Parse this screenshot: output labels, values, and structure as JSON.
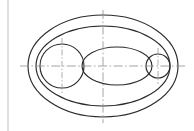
{
  "document": {
    "title": "Technical Drawing",
    "view_label": "",
    "background_color": "#ffffff",
    "line_color": "#2b2b2b",
    "centerline_color": "#8e8e8e",
    "border_color": "#b9b9b9"
  },
  "canvas": {
    "width": 194,
    "height": 131
  },
  "geometry": {
    "sheet_border": {
      "name": "left-margin-rule",
      "x1": 8,
      "y1": 0,
      "x2": 8,
      "y2": 131
    },
    "main_center": {
      "x": 103,
      "y": 66
    },
    "ellipses": [
      {
        "name": "outer-ellipse",
        "cx": 103,
        "cy": 66,
        "rx": 75,
        "ry": 51
      },
      {
        "name": "inner-ellipse",
        "cx": 103,
        "cy": 66,
        "rx": 67,
        "ry": 40
      },
      {
        "name": "middle-ellipse",
        "cx": 117,
        "cy": 66,
        "rx": 35,
        "ry": 19
      }
    ],
    "circles": [
      {
        "name": "left-circle",
        "cx": 62,
        "cy": 66,
        "r": 22
      },
      {
        "name": "right-circle",
        "cx": 158,
        "cy": 66,
        "r": 12
      }
    ],
    "centerlines": [
      {
        "name": "main-horizontal-centerline",
        "orientation": "horizontal",
        "x1": 20,
        "y1": 66,
        "x2": 186,
        "y2": 66
      },
      {
        "name": "main-vertical-centerline",
        "orientation": "vertical",
        "x1": 103,
        "y1": 10,
        "x2": 103,
        "y2": 123
      },
      {
        "name": "left-circle-vertical-centerline",
        "orientation": "vertical",
        "x1": 62,
        "y1": 38,
        "x2": 62,
        "y2": 94
      },
      {
        "name": "right-circle-vertical-centerline",
        "orientation": "vertical",
        "x1": 158,
        "y1": 48,
        "x2": 158,
        "y2": 84
      }
    ]
  },
  "chart_data": {
    "type": "diagram",
    "entities": [
      {
        "label": "Outer ellipse",
        "kind": "ellipse",
        "cx": 103,
        "cy": 66,
        "rx": 75,
        "ry": 51
      },
      {
        "label": "Inner ellipse",
        "kind": "ellipse",
        "cx": 103,
        "cy": 66,
        "rx": 67,
        "ry": 40
      },
      {
        "label": "Middle ellipse",
        "kind": "ellipse",
        "cx": 117,
        "cy": 66,
        "rx": 35,
        "ry": 19
      },
      {
        "label": "Left circle",
        "kind": "circle",
        "cx": 62,
        "cy": 66,
        "r": 22
      },
      {
        "label": "Right circle",
        "kind": "circle",
        "cx": 158,
        "cy": 66,
        "r": 12
      }
    ],
    "legend": [],
    "xlabel": "",
    "ylabel": ""
  }
}
